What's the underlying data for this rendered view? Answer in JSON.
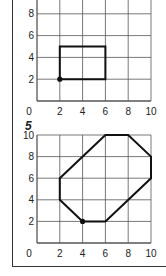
{
  "figures": [
    {
      "label": "",
      "x_ticks": [
        "0",
        "2",
        "4",
        "6",
        "8",
        "10"
      ],
      "y_ticks": [
        "2",
        "4",
        "6",
        "8"
      ],
      "shape": "rectangle",
      "vertices": [
        [
          2,
          2
        ],
        [
          2,
          5
        ],
        [
          6,
          5
        ],
        [
          6,
          2
        ]
      ],
      "start_point": [
        2,
        2
      ]
    },
    {
      "label": "5",
      "x_ticks": [
        "0",
        "2",
        "4",
        "6",
        "8",
        "10"
      ],
      "y_ticks": [
        "2",
        "4",
        "6",
        "8",
        "10"
      ],
      "shape": "octagon",
      "vertices": [
        [
          4,
          2
        ],
        [
          6,
          2
        ],
        [
          10,
          6
        ],
        [
          10,
          8
        ],
        [
          8,
          10
        ],
        [
          6,
          10
        ],
        [
          2,
          6
        ],
        [
          2,
          4
        ]
      ],
      "start_point": [
        4,
        2
      ]
    }
  ],
  "colors": {
    "grid": "#555555",
    "shape": "#111111",
    "frame": "#333333"
  }
}
